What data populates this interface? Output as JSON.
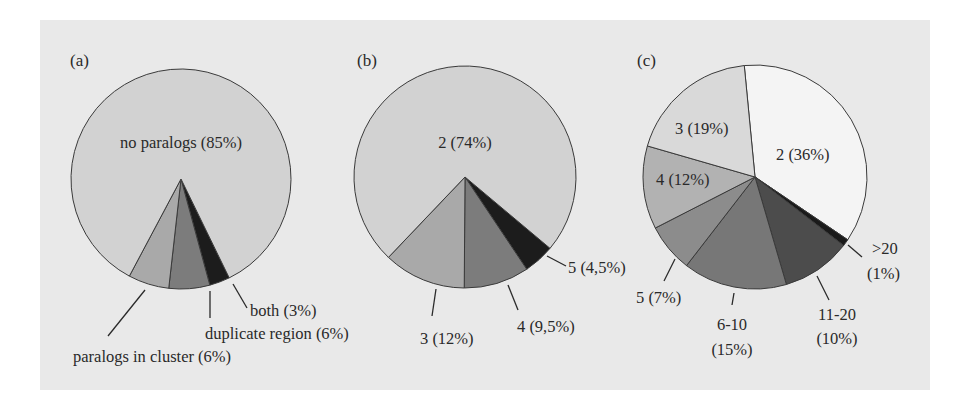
{
  "background": {
    "panel_color": "#e9e9e9",
    "page_color": "#ffffff"
  },
  "chart_data": [
    {
      "type": "pie",
      "panel": "(a)",
      "title": "",
      "start_angle_deg": 154,
      "direction": "clockwise",
      "slices": [
        {
          "label": "both (3%)",
          "value": 3,
          "color": "#1c1c1c"
        },
        {
          "label": "duplicate region (6%)",
          "value": 6,
          "color": "#7c7c7c"
        },
        {
          "label": "paralogs in cluster (6%)",
          "value": 6,
          "color": "#a9a9a9"
        },
        {
          "label": "no paralogs (85%)",
          "value": 85,
          "color": "#d2d2d2"
        }
      ]
    },
    {
      "type": "pie",
      "panel": "(b)",
      "title": "",
      "start_angle_deg": 130,
      "direction": "clockwise",
      "slices": [
        {
          "label": "5 (4,5%)",
          "value": 4.5,
          "color": "#1c1c1c"
        },
        {
          "label": "4 (9,5%)",
          "value": 9.5,
          "color": "#7c7c7c"
        },
        {
          "label": "3 (12%)",
          "value": 12,
          "color": "#a9a9a9"
        },
        {
          "label": "2 (74%)",
          "value": 74,
          "color": "#d2d2d2"
        }
      ]
    },
    {
      "type": "pie",
      "panel": "(c)",
      "title": "",
      "start_angle_deg": -5.5,
      "direction": "clockwise",
      "slices": [
        {
          "label": "2 (36%)",
          "value": 36,
          "color": "#f4f4f4"
        },
        {
          "label": ">20 (1%)",
          "value": 1,
          "color": "#1a1a1a"
        },
        {
          "label": "11-20 (10%)",
          "value": 10,
          "color": "#4c4c4c"
        },
        {
          "label": "6-10 (15%)",
          "value": 15,
          "color": "#777777"
        },
        {
          "label": "5 (7%)",
          "value": 7,
          "color": "#8c8c8c"
        },
        {
          "label": "4 (12%)",
          "value": 12,
          "color": "#b2b2b2"
        },
        {
          "label": "3 (19%)",
          "value": 19,
          "color": "#d9d9d9"
        }
      ]
    }
  ],
  "labels": {
    "a": {
      "panel": "(a)",
      "no_paralogs": "no paralogs (85%)",
      "both": "both (3%)",
      "duplicate_region": "duplicate region (6%)",
      "paralogs_in_cluster": "paralogs in cluster (6%)"
    },
    "b": {
      "panel": "(b)",
      "s2": "2 (74%)",
      "s3": "3 (12%)",
      "s4": "4 (9,5%)",
      "s5": "5 (4,5%)"
    },
    "c": {
      "panel": "(c)",
      "s2": "2 (36%)",
      "s3": "3 (19%)",
      "s4": "4 (12%)",
      "s5": "5 (7%)",
      "s6_10_line1": "6-10",
      "s6_10_line2": "(15%)",
      "s11_20_line1": "11-20",
      "s11_20_line2": "(10%)",
      "gt20_line1": ">20",
      "gt20_line2": "(1%)"
    }
  }
}
